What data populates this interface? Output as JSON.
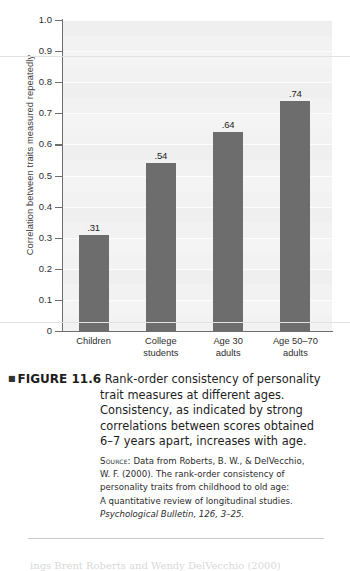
{
  "chart_data": {
    "type": "bar",
    "title": "",
    "xlabel": "",
    "ylabel": "Correlation between traits measured repeatedly",
    "ylim": [
      0,
      1.0
    ],
    "grid": true,
    "legend": "none",
    "categories": [
      "Children",
      "College students",
      "Age 30 adults",
      "Age 50–70 adults"
    ],
    "categories_lines": [
      [
        "Children",
        ""
      ],
      [
        "College",
        "students"
      ],
      [
        "Age 30",
        "adults"
      ],
      [
        "Age 50–70",
        "adults"
      ]
    ],
    "values": [
      0.31,
      0.54,
      0.64,
      0.74
    ],
    "value_labels": [
      ".31",
      ".54",
      ".64",
      ".74"
    ],
    "ytick_labels": [
      "1.0",
      "0.9",
      "0.8",
      "0.7",
      "0.6",
      "0.5",
      "0.4",
      "0.3",
      "0.2",
      "0.1",
      "0"
    ],
    "ytick_values": [
      1.0,
      0.9,
      0.8,
      0.7,
      0.6,
      0.5,
      0.4,
      0.3,
      0.2,
      0.1,
      0
    ],
    "bar_color": "#6d6d6d",
    "plot_background": "#f2f2f2",
    "axis_color": "#6e6e6e"
  },
  "caption": {
    "bullet": "■",
    "figure_label": "FIGURE 11.6",
    "lines": [
      "Rank-order consistency of personality",
      "trait measures at different ages.",
      "Consistency, as indicated by strong",
      "correlations between scores obtained",
      "6–7 years apart, increases with age."
    ]
  },
  "source": {
    "label": "Source:",
    "lines": [
      "Data from Roberts, B. W., & DelVecchio,",
      "W. F. (2000). The rank-order consistency of",
      "personality traits from childhood to old age:",
      "A quantitative review of longitudinal studies."
    ],
    "italic_line": "Psychological Bulletin, 126, 3–25."
  },
  "page_tail": {
    "text": "                     ings Brent Roberts and Wendy DelVecchio (2000)"
  }
}
